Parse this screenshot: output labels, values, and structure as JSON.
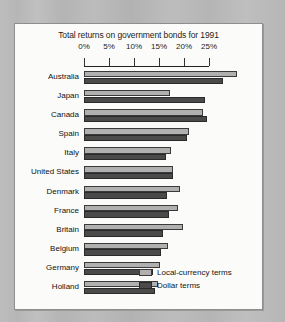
{
  "chart_data": {
    "type": "bar",
    "title": "Total returns on government bonds for 1991",
    "xlabel": "",
    "ylabel": "",
    "orientation": "horizontal",
    "xlim": [
      0,
      25
    ],
    "grid": false,
    "legend_position": "bottom-right",
    "tick_labels": [
      "0%",
      "5%",
      "10%",
      "15%",
      "20%",
      "25%"
    ],
    "tick_values": [
      0,
      5,
      10,
      15,
      20,
      25
    ],
    "categories": [
      "Australia",
      "Japan",
      "Canada",
      "Spain",
      "Italy",
      "United States",
      "Denmark",
      "France",
      "Britain",
      "Belgium",
      "Germany",
      "Holland"
    ],
    "series": [
      {
        "name": "Local-currency terms",
        "color": "#b0b0b0",
        "values": [
          30.6,
          17.2,
          23.8,
          21.0,
          17.4,
          17.8,
          19.2,
          18.8,
          19.8,
          16.8,
          15.2,
          14.8
        ]
      },
      {
        "name": "Dollar terms",
        "color": "#4a4a4a",
        "values": [
          27.8,
          24.2,
          24.6,
          20.6,
          16.4,
          17.8,
          16.6,
          17.0,
          15.8,
          15.4,
          13.8,
          14.2
        ]
      }
    ]
  },
  "legend": {
    "items": [
      {
        "label": "Local-currency terms"
      },
      {
        "label": "Dollar terms"
      }
    ]
  }
}
